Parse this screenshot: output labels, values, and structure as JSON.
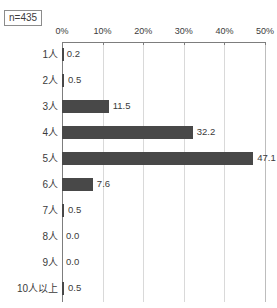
{
  "chart_data": {
    "type": "bar",
    "orientation": "horizontal",
    "title": "",
    "xlabel": "",
    "ylabel": "",
    "categories": [
      "1人",
      "2人",
      "3人",
      "4人",
      "5人",
      "6人",
      "7人",
      "8人",
      "9人",
      "10人以上"
    ],
    "values": [
      0.2,
      0.5,
      11.5,
      32.2,
      47.1,
      7.6,
      0.5,
      0.0,
      0.0,
      0.5
    ],
    "value_labels": [
      "0.2",
      "0.5",
      "11.5",
      "32.2",
      "47.1",
      "7.6",
      "0.5",
      "0.0",
      "0.0",
      "0.5"
    ],
    "xlim": [
      0,
      50
    ],
    "xticks": [
      0,
      10,
      20,
      30,
      40,
      50
    ],
    "xtick_labels": [
      "0%",
      "10%",
      "20%",
      "30%",
      "40%",
      "50%"
    ],
    "grid": true,
    "grid_axis": "x",
    "legend": false,
    "series": [
      {
        "name": "割合",
        "values": [
          0.2,
          0.5,
          11.5,
          32.2,
          47.1,
          7.6,
          0.5,
          0.0,
          0.0,
          0.5
        ]
      }
    ]
  },
  "annotations": {
    "sample_size": "n=435"
  },
  "colors": {
    "bar": "#484848",
    "axis": "#7d7d7d",
    "grid": "#d9d9d9",
    "text": "#3b3b3b",
    "background": "#ffffff"
  }
}
